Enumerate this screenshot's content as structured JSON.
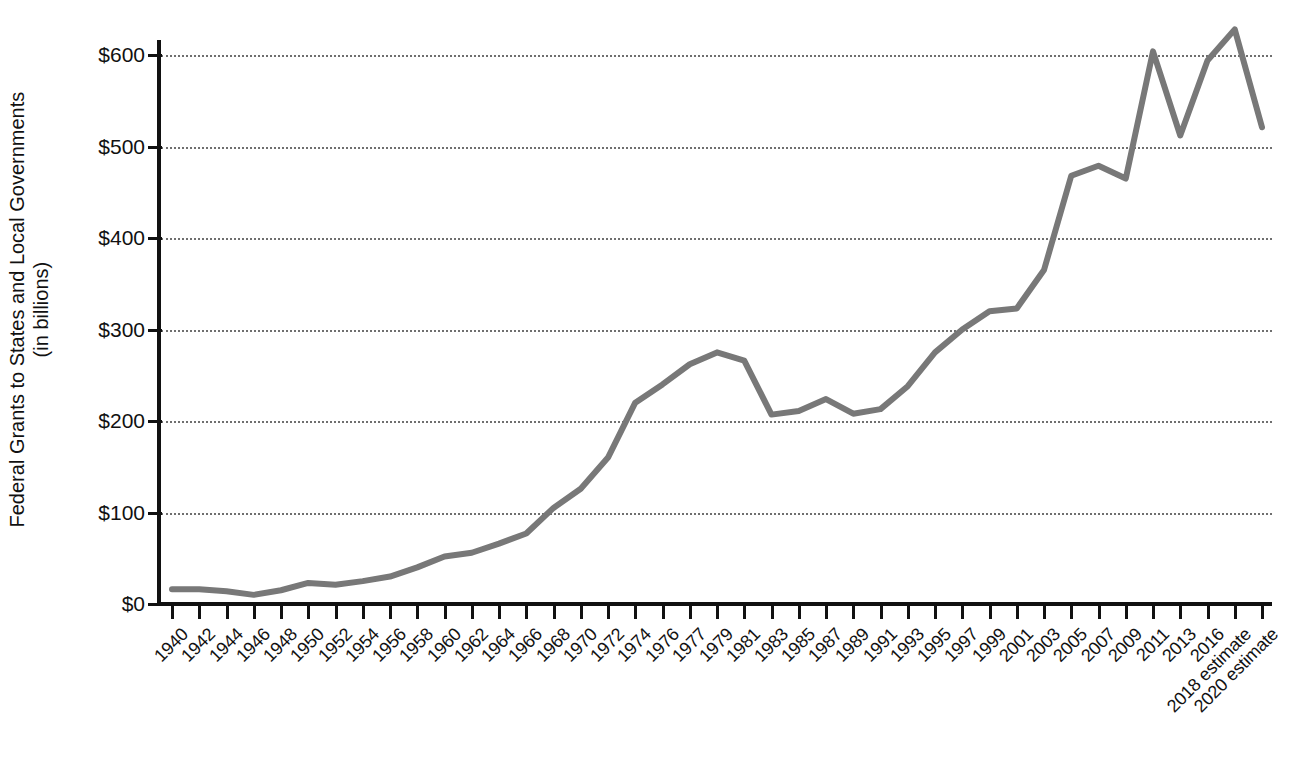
{
  "chart_data": {
    "type": "line",
    "title": "",
    "xlabel": "",
    "ylabel": "Federal Grants to States and Local Governments (in billions)",
    "ylabel_line1": "Federal Grants to States and Local Governments",
    "ylabel_line2": "(in billions)",
    "ylim": [
      0,
      600
    ],
    "ytick_labels": [
      "$0",
      "$100",
      "$200",
      "$300",
      "$400",
      "$500",
      "$600"
    ],
    "ytick_values": [
      0,
      100,
      200,
      300,
      400,
      500,
      600
    ],
    "grid": true,
    "legend": "none",
    "line_color": "#787878",
    "categories": [
      "1940",
      "1942",
      "1944",
      "1946",
      "1948",
      "1950",
      "1952",
      "1954",
      "1956",
      "1958",
      "1960",
      "1962",
      "1964",
      "1966",
      "1968",
      "1970",
      "1972",
      "1974",
      "1976",
      "1977",
      "1979",
      "1981",
      "1983",
      "1985",
      "1987",
      "1989",
      "1991",
      "1993",
      "1995",
      "1997",
      "1999",
      "2001",
      "2003",
      "2005",
      "2007",
      "2009",
      "2011",
      "2013",
      "2016",
      "2018 estimate",
      "2020 estimate"
    ],
    "values": [
      16,
      16,
      14,
      10,
      15,
      23,
      21,
      25,
      30,
      40,
      52,
      56,
      66,
      77,
      105,
      126,
      160,
      220,
      240,
      262,
      275,
      266,
      207,
      211,
      224,
      208,
      213,
      238,
      275,
      300,
      320,
      323,
      365,
      468,
      479,
      465,
      604,
      512,
      594,
      628,
      521
    ],
    "series_name": "Federal Grants to States and Local Governments"
  }
}
